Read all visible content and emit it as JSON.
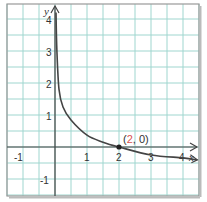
{
  "chart_data": {
    "type": "line",
    "title": "",
    "xlabel": "x",
    "ylabel": "y",
    "xlim": [
      -1.5,
      4.5
    ],
    "ylim": [
      -1.5,
      4.5
    ],
    "grid": true,
    "grid_step": 0.5,
    "x_ticks": [
      "-1",
      "1",
      "2",
      "3",
      "4"
    ],
    "y_ticks": [
      "4",
      "3",
      "2",
      "1",
      "-1"
    ],
    "series": [
      {
        "name": "curve",
        "x": [
          0.03,
          0.06,
          0.125,
          0.25,
          0.5,
          1,
          1.5,
          2,
          3,
          4,
          4.45
        ],
        "y": [
          4.2,
          3.0,
          1.8,
          1.25,
          0.84,
          0.37,
          0.15,
          0,
          -0.25,
          -0.34,
          -0.4
        ]
      }
    ],
    "annotations": [
      {
        "point": [
          2,
          0
        ],
        "label_open": "(",
        "label_x": "2",
        "label_rest": ", 0)",
        "highlight_color": "#d9534f"
      }
    ],
    "colors": {
      "grid": "#9fd6cf",
      "axis": "#444444",
      "curve": "#444444",
      "border": "#999999"
    }
  }
}
